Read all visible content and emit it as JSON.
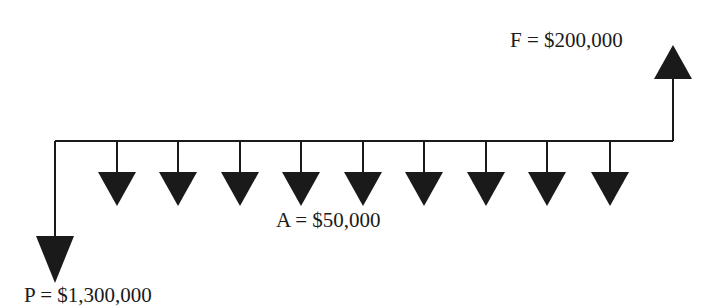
{
  "diagram": {
    "type": "cash-flow-diagram",
    "labels": {
      "future_value": "F = $200,000",
      "annuity": "A = $50,000",
      "present_value": "P = $1,300,000"
    },
    "colors": {
      "line": "#1a1a1a",
      "arrow": "#1a1a1a",
      "background": "#ffffff"
    },
    "timeline": {
      "y": 141,
      "x_start": 55,
      "x_end": 673
    },
    "present_arrow": {
      "x": 55,
      "direction": "down",
      "tip_y": 283
    },
    "future_arrow": {
      "x": 673,
      "direction": "up",
      "tip_y": 45
    },
    "annuity_arrows": {
      "count": 9,
      "direction": "down",
      "x": [
        117,
        178,
        240,
        301,
        363,
        424,
        486,
        547,
        610
      ]
    }
  }
}
